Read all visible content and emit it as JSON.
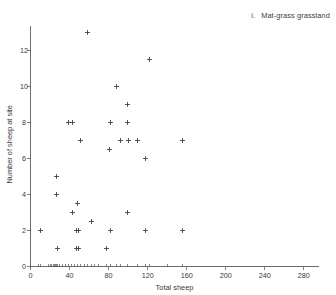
{
  "figure": {
    "panel_index": "i.",
    "panel_title": "Mat-grass grassland",
    "background_color": "#ffffff",
    "marker_color": "#3b3b3b",
    "axis_color": "#4a4a4a",
    "marker_symbol": "plus"
  },
  "chart_data": {
    "type": "scatter",
    "xlabel": "Total sheep",
    "ylabel": "Number of sheep at site",
    "xlim": [
      0,
      295
    ],
    "ylim": [
      0,
      13.6
    ],
    "grid": false,
    "legend": "none",
    "xticks": [
      0,
      40,
      80,
      120,
      160,
      200,
      240,
      280
    ],
    "xticklabels": [
      "0",
      "40",
      "80",
      "120",
      "160",
      "200",
      "240",
      "280"
    ],
    "yticks": [
      0,
      2,
      4,
      6,
      8,
      10,
      12
    ],
    "yticklabels": [
      "0",
      "2",
      "4",
      "6",
      "8",
      "10",
      "12"
    ],
    "points": [
      {
        "x": 10,
        "y": 2
      },
      {
        "x": 27,
        "y": 5
      },
      {
        "x": 27,
        "y": 4
      },
      {
        "x": 28,
        "y": 1
      },
      {
        "x": 39,
        "y": 8
      },
      {
        "x": 43,
        "y": 8
      },
      {
        "x": 43,
        "y": 3
      },
      {
        "x": 48,
        "y": 3.5
      },
      {
        "x": 47,
        "y": 2
      },
      {
        "x": 49,
        "y": 2
      },
      {
        "x": 47,
        "y": 1
      },
      {
        "x": 49,
        "y": 1
      },
      {
        "x": 51,
        "y": 7
      },
      {
        "x": 58,
        "y": 13
      },
      {
        "x": 62,
        "y": 2.5
      },
      {
        "x": 78,
        "y": 1
      },
      {
        "x": 81,
        "y": 6.5
      },
      {
        "x": 82,
        "y": 8
      },
      {
        "x": 82,
        "y": 2
      },
      {
        "x": 88,
        "y": 10
      },
      {
        "x": 92,
        "y": 7
      },
      {
        "x": 99,
        "y": 9
      },
      {
        "x": 99,
        "y": 8
      },
      {
        "x": 99,
        "y": 3
      },
      {
        "x": 100,
        "y": 7
      },
      {
        "x": 110,
        "y": 7
      },
      {
        "x": 118,
        "y": 6
      },
      {
        "x": 118,
        "y": 2
      },
      {
        "x": 122,
        "y": 11.5
      },
      {
        "x": 156,
        "y": 7
      },
      {
        "x": 156,
        "y": 2
      }
    ],
    "x_rug_values": [
      8,
      10,
      18,
      20,
      22,
      24,
      25,
      26,
      27,
      28,
      30,
      33,
      36,
      39,
      42,
      45,
      48,
      51,
      55,
      58,
      62,
      66,
      70,
      78,
      82,
      88,
      92,
      99,
      110,
      118,
      122,
      140,
      156
    ]
  }
}
